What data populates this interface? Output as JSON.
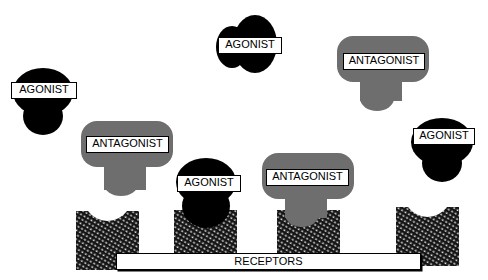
{
  "diagram": {
    "colors": {
      "agonist": "#000000",
      "antagonist": "#6e6e6e",
      "receptor_texture": "#1a1a1a",
      "background": "#ffffff"
    },
    "labels": {
      "agonist": "AGONIST",
      "antagonist": "ANTAGONIST",
      "receptors": "RECEPTORS"
    },
    "molecules": [
      {
        "type": "agonist",
        "label": "AGONIST",
        "state": "free"
      },
      {
        "type": "agonist",
        "label": "AGONIST",
        "state": "free"
      },
      {
        "type": "antagonist",
        "label": "ANTAGONIST",
        "state": "free"
      },
      {
        "type": "antagonist",
        "label": "ANTAGONIST",
        "state": "free"
      },
      {
        "type": "agonist",
        "label": "AGONIST",
        "state": "free"
      },
      {
        "type": "agonist",
        "label": "AGONIST",
        "state": "bound"
      },
      {
        "type": "antagonist",
        "label": "ANTAGONIST",
        "state": "bound"
      }
    ],
    "receptors": [
      {
        "index": 1,
        "occupied_by": "none"
      },
      {
        "index": 2,
        "occupied_by": "agonist"
      },
      {
        "index": 3,
        "occupied_by": "antagonist"
      },
      {
        "index": 4,
        "occupied_by": "none"
      }
    ]
  }
}
